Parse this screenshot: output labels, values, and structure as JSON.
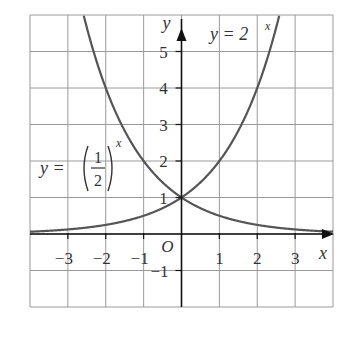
{
  "chart_data": {
    "type": "line",
    "title": "",
    "xlabel": "x",
    "ylabel": "y",
    "origin_label": "O",
    "xlim": [
      -4,
      4
    ],
    "ylim": [
      -2,
      6
    ],
    "grid": true,
    "x_ticks": [
      -3,
      -2,
      -1,
      1,
      2,
      3
    ],
    "x_tick_labels": [
      "−3",
      "−2",
      "−1",
      "1",
      "2",
      "3"
    ],
    "y_ticks": [
      -1,
      1,
      2,
      3,
      4,
      5
    ],
    "y_tick_labels": [
      "−1",
      "1",
      "2",
      "3",
      "4",
      "5"
    ],
    "series": [
      {
        "name": "y = 2^x",
        "label_text": "y = 2",
        "label_exponent": "x",
        "x": [
          -4,
          -3,
          -2,
          -1,
          0,
          1,
          2,
          2.58
        ],
        "values": [
          0.0625,
          0.125,
          0.25,
          0.5,
          1,
          2,
          4,
          6
        ]
      },
      {
        "name": "y = (1/2)^x",
        "label_text": "y =",
        "label_fraction": [
          "1",
          "2"
        ],
        "label_exponent": "x",
        "x": [
          -2.58,
          -2,
          -1,
          0,
          1,
          2,
          3,
          4
        ],
        "values": [
          6,
          4,
          2,
          1,
          0.5,
          0.25,
          0.125,
          0.0625
        ]
      }
    ],
    "intersection": {
      "x": 0,
      "y": 1
    }
  },
  "colors": {
    "curve": "#555555",
    "grid": "#9a9a9a",
    "axis": "#111111"
  }
}
